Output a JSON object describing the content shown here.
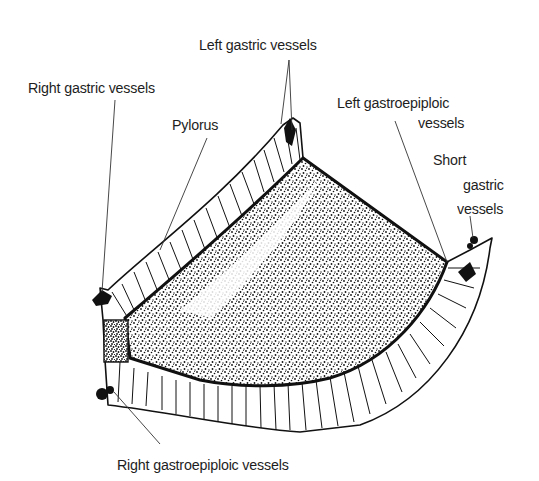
{
  "diagram": {
    "labels": {
      "left_gastric": "Left gastric vessels",
      "right_gastric": "Right gastric vessels",
      "pylorus": "Pylorus",
      "left_gastroepiploic_line1": "Left gastroepiploic",
      "left_gastroepiploic_line2": "vessels",
      "short_gastric_line1": "Short",
      "short_gastric_line2": "gastric",
      "short_gastric_line3": "vessels",
      "right_gastroepiploic": "Right gastroepiploic vessels"
    },
    "colors": {
      "background": "#ffffff",
      "ink": "#111111",
      "leader_line": "#333333",
      "text": "#1e1e1e"
    }
  }
}
